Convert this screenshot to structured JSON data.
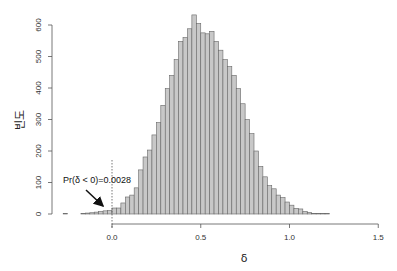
{
  "chart_data": {
    "type": "bar",
    "title": "",
    "xlabel": "δ",
    "ylabel": "빈도",
    "bin_width": 0.025,
    "x_start": -0.275,
    "xlim": [
      -0.3,
      1.5
    ],
    "ylim": [
      0,
      630
    ],
    "x_ticks": [
      0.0,
      0.5,
      1.0,
      1.5
    ],
    "x_tick_labels": [
      "0.0",
      "0.5",
      "1.0",
      "1.5"
    ],
    "y_ticks": [
      0,
      100,
      200,
      300,
      400,
      500,
      600
    ],
    "y_tick_labels": [
      "0",
      "100",
      "200",
      "300",
      "400",
      "500",
      "600"
    ],
    "grid": false,
    "bar_color": "#c8c8c8",
    "bar_edge": "#666666",
    "values": [
      2,
      0,
      0,
      0,
      1,
      3,
      4,
      6,
      8,
      10,
      11,
      19,
      19,
      35,
      54,
      60,
      83,
      140,
      181,
      203,
      251,
      290,
      345,
      398,
      440,
      490,
      548,
      560,
      588,
      632,
      605,
      575,
      572,
      580,
      548,
      520,
      490,
      468,
      440,
      398,
      350,
      300,
      255,
      200,
      151,
      118,
      90,
      80,
      60,
      52,
      38,
      28,
      18,
      16,
      8,
      5,
      2,
      2,
      1,
      1
    ],
    "annotation": {
      "text": "Pr(δ < 0)=0.0028",
      "arrow_to_x": -0.005,
      "arrow_to_y": 12,
      "vline_x": 0.0
    }
  }
}
